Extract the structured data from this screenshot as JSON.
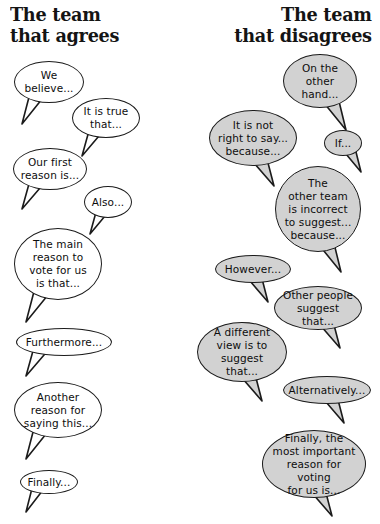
{
  "page": {
    "background": "#ffffff",
    "ink": "#1b1b1b",
    "bubble_fill_left": "#ffffff",
    "bubble_fill_right": "#d2d2d2"
  },
  "headings": {
    "left": "The team\nthat agrees",
    "right": "The team\nthat disagrees"
  },
  "columns": [
    {
      "name": "agrees",
      "side": "left",
      "fill": "white",
      "bubbles": [
        {
          "id": "we-believe",
          "text": "We\nbelieve...",
          "x": 14,
          "y": 61,
          "w": 70,
          "h": 42,
          "tail": "down-left",
          "tx": 22,
          "ty": 96,
          "tw": 26,
          "th": 30
        },
        {
          "id": "it-is-true",
          "text": "It is true\nthat...",
          "x": 72,
          "y": 98,
          "w": 68,
          "h": 40,
          "tail": "down-left",
          "tx": 82,
          "ty": 132,
          "tw": 24,
          "th": 26
        },
        {
          "id": "our-first-reason",
          "text": "Our first\nreason is...",
          "x": 13,
          "y": 148,
          "w": 74,
          "h": 42,
          "tail": "down-left",
          "tx": 22,
          "ty": 183,
          "tw": 26,
          "th": 28
        },
        {
          "id": "also",
          "text": "Also...",
          "x": 84,
          "y": 186,
          "w": 48,
          "h": 32,
          "tail": "down-left",
          "tx": 90,
          "ty": 212,
          "tw": 22,
          "th": 24
        },
        {
          "id": "the-main-reason",
          "text": "The main\nreason to\nvote for us\nis that...",
          "x": 14,
          "y": 228,
          "w": 88,
          "h": 72,
          "tail": "down-left",
          "tx": 26,
          "ty": 292,
          "tw": 28,
          "th": 32
        },
        {
          "id": "furthermore",
          "text": "Furthermore...",
          "x": 16,
          "y": 328,
          "w": 96,
          "h": 28,
          "tail": "down-left",
          "tx": 26,
          "ty": 350,
          "tw": 26,
          "th": 28
        },
        {
          "id": "another-reason",
          "text": "Another\nreason for\nsaying this...",
          "x": 14,
          "y": 382,
          "w": 88,
          "h": 56,
          "tail": "down-left",
          "tx": 26,
          "ty": 431,
          "tw": 26,
          "th": 30
        },
        {
          "id": "finally",
          "text": "Finally...",
          "x": 20,
          "y": 470,
          "w": 58,
          "h": 24,
          "tail": "down-left",
          "tx": 26,
          "ty": 488,
          "tw": 22,
          "th": 26
        }
      ]
    },
    {
      "name": "disagrees",
      "side": "right",
      "fill": "gray",
      "bubbles": [
        {
          "id": "on-the-other-hand",
          "text": "On the\nother\nhand...",
          "x": 283,
          "y": 54,
          "w": 74,
          "h": 54,
          "tail": "down-right",
          "tx": 320,
          "ty": 100,
          "tw": 26,
          "th": 32
        },
        {
          "id": "it-is-not-right",
          "text": "It is not\nright to say...\nbecause...",
          "x": 209,
          "y": 110,
          "w": 88,
          "h": 56,
          "tail": "down-right",
          "tx": 248,
          "ty": 158,
          "tw": 26,
          "th": 30
        },
        {
          "id": "if",
          "text": "If...",
          "x": 324,
          "y": 130,
          "w": 38,
          "h": 26,
          "tail": "down-right",
          "tx": 341,
          "ty": 150,
          "tw": 20,
          "th": 24
        },
        {
          "id": "other-team",
          "text": "The\nother team\nis incorrect\nto suggest...\nbecause...",
          "x": 275,
          "y": 166,
          "w": 86,
          "h": 86,
          "tail": "down-right",
          "tx": 315,
          "ty": 242,
          "tw": 26,
          "th": 32
        },
        {
          "id": "however",
          "text": "However...",
          "x": 215,
          "y": 255,
          "w": 76,
          "h": 28,
          "tail": "down-right",
          "tx": 244,
          "ty": 276,
          "tw": 24,
          "th": 28
        },
        {
          "id": "other-people",
          "text": "Other people\nsuggest that...",
          "x": 274,
          "y": 286,
          "w": 88,
          "h": 44,
          "tail": "down-right",
          "tx": 314,
          "ty": 320,
          "tw": 26,
          "th": 30
        },
        {
          "id": "a-different-view",
          "text": "A different\nview is to\nsuggest that...",
          "x": 197,
          "y": 322,
          "w": 90,
          "h": 60,
          "tail": "down-right",
          "tx": 236,
          "ty": 373,
          "tw": 26,
          "th": 30
        },
        {
          "id": "alternatively",
          "text": "Alternatively...",
          "x": 283,
          "y": 376,
          "w": 88,
          "h": 28,
          "tail": "down-right",
          "tx": 320,
          "ty": 397,
          "tw": 24,
          "th": 28
        },
        {
          "id": "finally-most",
          "text": "Finally, the\nmost important\nreason for voting\nfor us is...",
          "x": 262,
          "y": 430,
          "w": 104,
          "h": 68,
          "tail": "down-right",
          "tx": 306,
          "ty": 488,
          "tw": 26,
          "th": 30
        }
      ]
    }
  ]
}
